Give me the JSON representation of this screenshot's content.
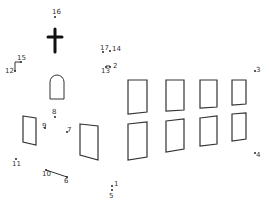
{
  "puzzle": {
    "type": "connect-the-dots",
    "subject": "church",
    "line_color": "#333333",
    "dots": [
      {
        "n": "1",
        "x": 112,
        "y": 186,
        "lx": 114,
        "ly": 181
      },
      {
        "n": "2",
        "x": 110,
        "y": 67,
        "lx": 113,
        "ly": 63
      },
      {
        "n": "3",
        "x": 255,
        "y": 71,
        "lx": 256,
        "ly": 67
      },
      {
        "n": "4",
        "x": 255,
        "y": 153,
        "lx": 256,
        "ly": 152
      },
      {
        "n": "5",
        "x": 112,
        "y": 190,
        "lx": 109,
        "ly": 193
      },
      {
        "n": "6",
        "x": 67,
        "y": 177,
        "lx": 64,
        "ly": 178
      },
      {
        "n": "7",
        "x": 67,
        "y": 132,
        "lx": 67,
        "ly": 127
      },
      {
        "n": "8",
        "x": 55,
        "y": 117,
        "lx": 52,
        "ly": 109
      },
      {
        "n": "9",
        "x": 45,
        "y": 128,
        "lx": 42,
        "ly": 123
      },
      {
        "n": "10",
        "x": 46,
        "y": 170,
        "lx": 42,
        "ly": 171
      },
      {
        "n": "11",
        "x": 16,
        "y": 159,
        "lx": 12,
        "ly": 161
      },
      {
        "n": "12",
        "x": 15,
        "y": 71,
        "lx": 5,
        "ly": 68
      },
      {
        "n": "13",
        "x": 106,
        "y": 67,
        "lx": 101,
        "ly": 68
      },
      {
        "n": "14",
        "x": 110,
        "y": 51,
        "lx": 112,
        "ly": 46
      },
      {
        "n": "15",
        "x": 21,
        "y": 62,
        "lx": 17,
        "ly": 55
      },
      {
        "n": "16",
        "x": 55,
        "y": 17,
        "lx": 52,
        "ly": 9
      },
      {
        "n": "17",
        "x": 103,
        "y": 52,
        "lx": 100,
        "ly": 45
      }
    ],
    "drawn_segments": [
      [
        15,
        71,
        15,
        62
      ],
      [
        15,
        62,
        21,
        62
      ],
      [
        106,
        66,
        110,
        66
      ],
      [
        46,
        170,
        67,
        177
      ]
    ],
    "cross": {
      "cx": 55,
      "top": 29,
      "bottom": 52,
      "arm_y": 37,
      "arm_left": 48,
      "arm_right": 62
    },
    "arch_window": {
      "x": 50,
      "y": 75,
      "w": 14,
      "h": 24
    },
    "windows": [
      {
        "pts": "23,116 36,118 36,145 23,142"
      },
      {
        "pts": "80,124 98,126 98,160 80,155"
      },
      {
        "pts": "128,80 147,80 147,112 128,114"
      },
      {
        "pts": "166,80 184,80 184,110 166,111"
      },
      {
        "pts": "200,80 217,80 217,107 200,108"
      },
      {
        "pts": "232,80 246,80 246,104 232,105"
      },
      {
        "pts": "128,124 147,122 147,157 128,160"
      },
      {
        "pts": "166,121 184,119 184,149 166,152"
      },
      {
        "pts": "200,118 217,116 217,144 200,146"
      },
      {
        "pts": "232,114 246,113 246,139 232,141"
      }
    ]
  }
}
